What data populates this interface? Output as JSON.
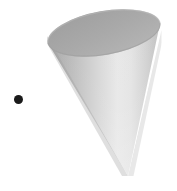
{
  "figure": {
    "canvas": {
      "width": 177,
      "height": 191,
      "background_color": "#ffffff"
    },
    "shapes": [
      {
        "name": "cone",
        "type": "cone-3d",
        "orientation": "apex-down",
        "rim": {
          "center_x": 104,
          "center_y": 33,
          "radius_x": 57,
          "radius_y": 22,
          "rotation_deg": -10,
          "fill_color": "#a8a8a8",
          "edge_color": "#9a9a9a"
        },
        "apex": {
          "x": 128,
          "y": 176
        },
        "body": {
          "shade_dark_color": "#ababab",
          "shade_mid_color": "#c8c8c8",
          "shade_light_color": "#ebebeb",
          "shade_edge_color": "#bdbdbd"
        }
      },
      {
        "name": "marker-point",
        "type": "dot",
        "center_x": 18.5,
        "center_y": 99.5,
        "radius": 4.5,
        "fill_color": "#1a1a1a"
      }
    ]
  }
}
